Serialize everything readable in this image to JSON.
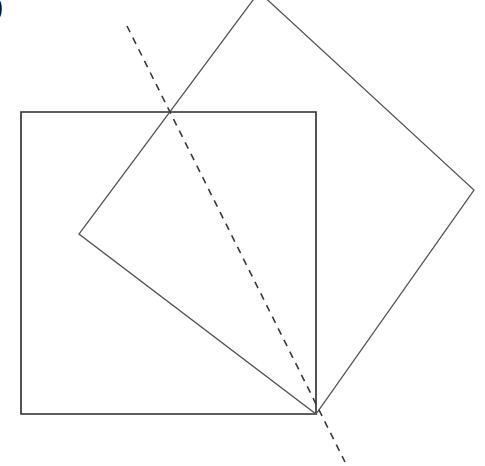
{
  "figure": {
    "panel_label": ")",
    "width": 485,
    "height": 466,
    "background_color": "#ffffff"
  },
  "colors": {
    "axis_square_stroke": "#2b2b2b",
    "rotated_square_stroke": "#555555",
    "dashed_line_stroke": "#3a3a3a",
    "background": "#ffffff"
  },
  "chart_data": {
    "type": "diagram",
    "title": "",
    "coordinate_system": "pixels, origin top-left, y increases downward",
    "shapes": [
      {
        "id": "axis-aligned-square",
        "name": "Axis-aligned square",
        "kind": "polygon",
        "closed": true,
        "stroke": "#2b2b2b",
        "stroke_width": 1.6,
        "fill": "none",
        "dash": "none",
        "side_length": 302,
        "rotation_deg": 0,
        "points": [
          [
            21,
            112
          ],
          [
            316,
            112
          ],
          [
            316,
            414
          ],
          [
            21,
            414
          ]
        ]
      },
      {
        "id": "rotated-square",
        "name": "Rotated square",
        "kind": "polygon",
        "closed": true,
        "stroke": "#555555",
        "stroke_width": 1.3,
        "fill": "none",
        "dash": "none",
        "side_length": 291,
        "rotation_deg": 46,
        "note": "Top vertex is cropped by the top edge of the image",
        "points": [
          [
            259,
            -8
          ],
          [
            474,
            190
          ],
          [
            316,
            414
          ],
          [
            79,
            234
          ]
        ]
      },
      {
        "id": "dashed-line",
        "name": "Dashed diagonal line",
        "kind": "line",
        "closed": false,
        "stroke": "#3a3a3a",
        "stroke_width": 1.6,
        "fill": "none",
        "dash": "7 6",
        "slope": 2.0,
        "points": [
          [
            127,
            26
          ],
          [
            345,
            462
          ]
        ]
      }
    ],
    "intersection_points": [
      {
        "id": "triple-intersection-top",
        "label": "Top intersection",
        "x": 168,
        "y": 112,
        "members": [
          "axis-aligned-square top edge",
          "rotated-square upper-left edge",
          "dashed-line"
        ]
      },
      {
        "id": "convergence-bottom-right",
        "label": "Bottom-right convergence",
        "x": 316,
        "y": 414,
        "members": [
          "axis-aligned-square bottom-right corner",
          "rotated-square bottom vertex",
          "dashed-line"
        ]
      }
    ]
  }
}
